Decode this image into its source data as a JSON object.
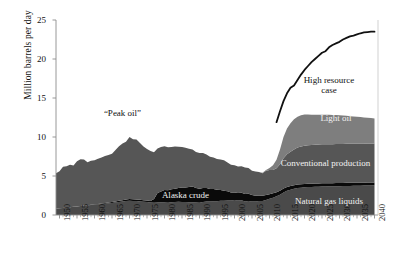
{
  "chart_data": {
    "type": "area",
    "title": "",
    "subtitle": "",
    "xlabel": "",
    "ylabel": "Million barrels per day",
    "xlim": [
      1949,
      2041
    ],
    "ylim": [
      0,
      25
    ],
    "grid": false,
    "legend_position": "inline-annotations",
    "yticks": [
      0,
      5,
      10,
      15,
      20,
      25
    ],
    "ytick_labels": [
      "0",
      "5",
      "10",
      "15",
      "20",
      "25"
    ],
    "xticks": [
      1950,
      1955,
      1960,
      1965,
      1970,
      1975,
      1980,
      1985,
      1990,
      1995,
      2000,
      2005,
      2010,
      2015,
      2020,
      2025,
      2030,
      2035,
      2040
    ],
    "xtick_labels": [
      "1950",
      "1955",
      "1960",
      "1965",
      "1970",
      "1975",
      "1980",
      "1985",
      "1990",
      "1995",
      "2000",
      "2005",
      "2010",
      "2015",
      "2020",
      "2025",
      "2030",
      "2035",
      "2040"
    ],
    "minor_tick_interval": 1,
    "stacked": true,
    "x": [
      1949,
      1950,
      1951,
      1952,
      1953,
      1954,
      1955,
      1956,
      1957,
      1958,
      1959,
      1960,
      1961,
      1962,
      1963,
      1964,
      1965,
      1966,
      1967,
      1968,
      1969,
      1970,
      1971,
      1972,
      1973,
      1974,
      1975,
      1976,
      1977,
      1978,
      1979,
      1980,
      1981,
      1982,
      1983,
      1984,
      1985,
      1986,
      1987,
      1988,
      1989,
      1990,
      1991,
      1992,
      1993,
      1994,
      1995,
      1996,
      1997,
      1998,
      1999,
      2000,
      2001,
      2002,
      2003,
      2004,
      2005,
      2006,
      2007,
      2008,
      2009,
      2010,
      2011,
      2012,
      2013,
      2014,
      2015,
      2016,
      2017,
      2018,
      2019,
      2020,
      2021,
      2022,
      2023,
      2024,
      2025,
      2026,
      2027,
      2028,
      2029,
      2030,
      2031,
      2032,
      2033,
      2034,
      2035,
      2036,
      2037,
      2038,
      2039,
      2040
    ],
    "series": [
      {
        "name": "Natural gas liquids",
        "color": "#4a4a4a",
        "values": [
          0.8,
          0.85,
          0.9,
          0.95,
          1.0,
          1.05,
          1.1,
          1.15,
          1.2,
          1.22,
          1.28,
          1.32,
          1.36,
          1.4,
          1.45,
          1.5,
          1.55,
          1.62,
          1.68,
          1.72,
          1.78,
          1.82,
          1.8,
          1.78,
          1.74,
          1.7,
          1.66,
          1.6,
          1.58,
          1.6,
          1.62,
          1.6,
          1.58,
          1.62,
          1.66,
          1.7,
          1.68,
          1.66,
          1.64,
          1.62,
          1.6,
          1.58,
          1.66,
          1.74,
          1.74,
          1.76,
          1.76,
          1.83,
          1.82,
          1.86,
          1.85,
          1.91,
          1.87,
          1.88,
          1.72,
          1.8,
          1.72,
          1.74,
          1.78,
          1.78,
          1.91,
          2.07,
          2.22,
          2.4,
          2.6,
          2.9,
          3.1,
          3.25,
          3.35,
          3.45,
          3.5,
          3.55,
          3.58,
          3.6,
          3.62,
          3.63,
          3.65,
          3.66,
          3.67,
          3.68,
          3.69,
          3.7,
          3.71,
          3.72,
          3.73,
          3.74,
          3.75,
          3.76,
          3.77,
          3.78,
          3.79,
          3.8
        ]
      },
      {
        "name": "Alaska crude",
        "color": "#0a0a0a",
        "values": [
          0.0,
          0.0,
          0.0,
          0.0,
          0.0,
          0.0,
          0.0,
          0.0,
          0.02,
          0.03,
          0.04,
          0.05,
          0.06,
          0.07,
          0.08,
          0.1,
          0.11,
          0.12,
          0.14,
          0.16,
          0.2,
          0.23,
          0.22,
          0.2,
          0.2,
          0.19,
          0.19,
          0.2,
          0.46,
          1.23,
          1.4,
          1.62,
          1.6,
          1.69,
          1.71,
          1.76,
          1.85,
          1.87,
          1.96,
          2.02,
          1.87,
          1.77,
          1.8,
          1.71,
          1.58,
          1.56,
          1.48,
          1.39,
          1.3,
          1.18,
          1.05,
          0.97,
          0.96,
          0.98,
          0.98,
          0.91,
          0.86,
          0.74,
          0.72,
          0.68,
          0.65,
          0.6,
          0.56,
          0.53,
          0.51,
          0.49,
          0.48,
          0.47,
          0.46,
          0.45,
          0.44,
          0.43,
          0.43,
          0.42,
          0.42,
          0.42,
          0.41,
          0.41,
          0.41,
          0.4,
          0.4,
          0.4,
          0.4,
          0.4,
          0.39,
          0.39,
          0.39,
          0.39,
          0.38,
          0.38,
          0.38,
          0.38
        ]
      },
      {
        "name": "Conventional production",
        "color": "#565656",
        "values": [
          4.55,
          4.75,
          5.3,
          5.3,
          5.45,
          5.3,
          5.8,
          6.0,
          5.9,
          5.5,
          5.65,
          5.65,
          5.8,
          5.9,
          6.05,
          6.1,
          6.2,
          6.6,
          7.0,
          7.3,
          7.4,
          7.95,
          7.7,
          7.7,
          7.3,
          6.9,
          6.6,
          6.4,
          6.0,
          5.7,
          5.7,
          5.6,
          5.5,
          5.4,
          5.4,
          5.3,
          5.2,
          5.1,
          4.9,
          4.75,
          4.6,
          4.6,
          4.5,
          4.3,
          4.15,
          4.05,
          3.95,
          3.9,
          3.9,
          3.7,
          3.55,
          3.5,
          3.4,
          3.4,
          3.4,
          3.3,
          3.1,
          3.1,
          3.0,
          2.9,
          3.1,
          3.1,
          3.0,
          3.05,
          3.4,
          3.9,
          4.2,
          4.4,
          4.6,
          4.75,
          4.85,
          4.9,
          4.92,
          4.94,
          4.96,
          4.98,
          5.0,
          5.0,
          5.0,
          5.0,
          5.0,
          5.0,
          5.0,
          5.0,
          5.0,
          5.0,
          5.0,
          5.0,
          5.0,
          5.0,
          5.0,
          5.0
        ]
      },
      {
        "name": "Light oil",
        "color": "#7e7e7e",
        "values": [
          0.0,
          0.0,
          0.0,
          0.0,
          0.0,
          0.0,
          0.0,
          0.0,
          0.0,
          0.0,
          0.0,
          0.0,
          0.0,
          0.0,
          0.0,
          0.0,
          0.0,
          0.0,
          0.0,
          0.0,
          0.0,
          0.0,
          0.0,
          0.0,
          0.0,
          0.0,
          0.0,
          0.0,
          0.0,
          0.0,
          0.0,
          0.0,
          0.0,
          0.0,
          0.0,
          0.0,
          0.0,
          0.0,
          0.0,
          0.0,
          0.0,
          0.0,
          0.0,
          0.0,
          0.0,
          0.0,
          0.0,
          0.0,
          0.0,
          0.0,
          0.0,
          0.0,
          0.0,
          0.0,
          0.0,
          0.0,
          0.0,
          0.0,
          0.0,
          0.05,
          0.12,
          0.25,
          0.6,
          1.1,
          1.9,
          2.7,
          3.3,
          3.65,
          3.85,
          3.95,
          4.0,
          4.0,
          3.95,
          3.9,
          3.85,
          3.82,
          3.8,
          3.78,
          3.76,
          3.74,
          3.72,
          3.7,
          3.65,
          3.6,
          3.55,
          3.5,
          3.45,
          3.4,
          3.35,
          3.3,
          3.25,
          3.2
        ]
      }
    ],
    "overlay_lines": [
      {
        "name": "High resource case",
        "color": "#111111",
        "x": [
          2012,
          2013,
          2014,
          2015,
          2016,
          2017,
          2018,
          2019,
          2020,
          2021,
          2022,
          2023,
          2024,
          2025,
          2026,
          2027,
          2028,
          2029,
          2030,
          2031,
          2032,
          2033,
          2034,
          2035,
          2036,
          2037,
          2038,
          2039,
          2040
        ],
        "values": [
          11.9,
          13.3,
          14.6,
          15.6,
          16.3,
          16.6,
          17.3,
          18.0,
          18.6,
          19.1,
          19.6,
          20.0,
          20.4,
          20.8,
          21.0,
          21.5,
          21.8,
          22.0,
          22.2,
          22.5,
          22.7,
          22.9,
          23.0,
          23.15,
          23.3,
          23.4,
          23.45,
          23.5,
          23.5
        ]
      }
    ],
    "annotations": [
      {
        "name": "peak-oil",
        "text": "“Peak oil”",
        "x": 1968,
        "y": 13.0,
        "color": "#111111"
      },
      {
        "name": "high-resource-case",
        "text": "High resource",
        "text2": "case",
        "x": 2027,
        "y": 17.2,
        "color": "#111111"
      },
      {
        "name": "light-oil",
        "text": "Light oil",
        "x": 2029,
        "y": 12.3,
        "color": "#f2f2f2"
      },
      {
        "name": "conventional-production",
        "text": "Conventional production",
        "x": 2026,
        "y": 6.5,
        "color": "#f2f2f2"
      },
      {
        "name": "alaska-crude",
        "text": "Alaska crude",
        "x": 1986,
        "y": 2.4,
        "color": "#f2f2f2"
      },
      {
        "name": "natural-gas-liquids",
        "text": "Natural gas liquids",
        "x": 2027,
        "y": 1.7,
        "color": "#f2f2f2"
      }
    ]
  }
}
